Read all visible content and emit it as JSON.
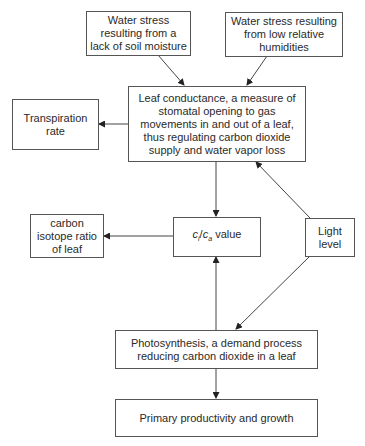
{
  "nodes": {
    "soil_moisture": {
      "label": "Water stress resulting from a lack of soil moisture"
    },
    "humidity": {
      "label": "Water stress resulting from low relative humidities"
    },
    "leaf_conductance": {
      "label": "Leaf conductance, a measure of stomatal opening to gas movements in and out of a leaf, thus regulating carbon dioxide supply and water vapor loss"
    },
    "transpiration": {
      "label": "Transpiration rate"
    },
    "carbon_isotope": {
      "label": "carbon isotope ratio of leaf"
    },
    "ci_ca": {
      "var1": "c",
      "sub1": "i",
      "slash": "/",
      "var2": "c",
      "sub2": "a",
      "suffix": " value"
    },
    "light": {
      "label": "Light level"
    },
    "photosynthesis": {
      "label": "Photosynthesis, a demand process reducing carbon dioxide in a leaf"
    },
    "productivity": {
      "label": "Primary productivity and growth"
    }
  },
  "edges": [
    {
      "from": "soil_moisture",
      "to": "leaf_conductance"
    },
    {
      "from": "humidity",
      "to": "leaf_conductance"
    },
    {
      "from": "leaf_conductance",
      "to": "transpiration"
    },
    {
      "from": "leaf_conductance",
      "to": "ci_ca"
    },
    {
      "from": "light",
      "to": "leaf_conductance"
    },
    {
      "from": "ci_ca",
      "to": "carbon_isotope"
    },
    {
      "from": "light",
      "to": "photosynthesis"
    },
    {
      "from": "photosynthesis",
      "to": "ci_ca"
    },
    {
      "from": "photosynthesis",
      "to": "productivity"
    }
  ]
}
